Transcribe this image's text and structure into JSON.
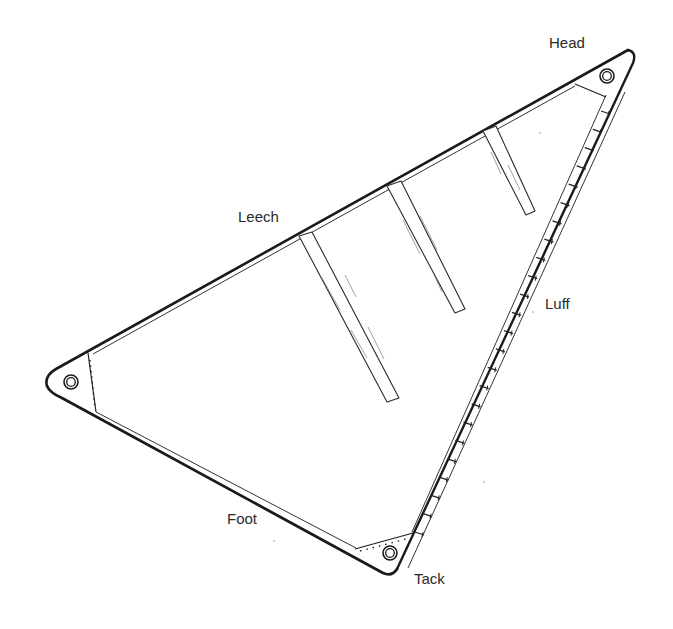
{
  "diagram": {
    "colors": {
      "background": "#ffffff",
      "line": "#1a1a1a",
      "label": "#2a2a2a"
    },
    "labels": {
      "head": "Head",
      "leech": "Leech",
      "luff": "Luff",
      "foot": "Foot",
      "tack": "Tack"
    },
    "corners": {
      "head": {
        "x": 634,
        "y": 55
      },
      "clew": {
        "x": 47,
        "y": 383
      },
      "tack": {
        "x": 392,
        "y": 572
      }
    },
    "grommets": [
      {
        "name": "head-grommet",
        "cx": 607,
        "cy": 76
      },
      {
        "name": "clew-grommet",
        "cx": 71,
        "cy": 382
      },
      {
        "name": "tack-grommet",
        "cx": 390,
        "cy": 553
      }
    ],
    "battens": [
      {
        "name": "batten-1",
        "points": "299,236 312,232 399,398 387,402"
      },
      {
        "name": "batten-2",
        "points": "387,186 401,181 465,309 455,313"
      },
      {
        "name": "batten-3",
        "points": "483,131 496,126 535,211 526,215"
      }
    ],
    "hank_count": 24
  }
}
